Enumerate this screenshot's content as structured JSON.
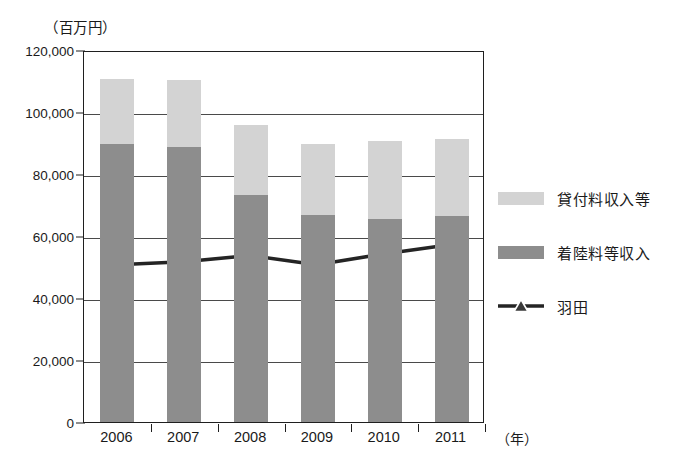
{
  "chart_data": {
    "type": "bar",
    "title": "",
    "subtitle": "",
    "unit_label": "（百万円）",
    "xlabel": "（年）",
    "ylabel": "",
    "categories": [
      "2006",
      "2007",
      "2008",
      "2009",
      "2010",
      "2011"
    ],
    "ylim": [
      0,
      120000
    ],
    "ytick_labels": [
      "0",
      "20,000",
      "40,000",
      "60,000",
      "80,000",
      "100,000",
      "120,000"
    ],
    "ytick_values": [
      0,
      20000,
      40000,
      60000,
      80000,
      100000,
      120000
    ],
    "grid": true,
    "legend_position": "right",
    "stacked": true,
    "series": [
      {
        "name": "着陸料等収入",
        "kind": "bar",
        "stack_order": 0,
        "color": "#8d8d8d",
        "values": [
          89700,
          88700,
          73200,
          66800,
          65500,
          66500
        ]
      },
      {
        "name": "貸付料収入等",
        "kind": "bar",
        "stack_order": 1,
        "color": "#d3d3d3",
        "values": [
          20900,
          21600,
          22600,
          22900,
          25100,
          24800
        ]
      },
      {
        "name": "羽田",
        "kind": "line",
        "color": "#242424",
        "marker": "triangle",
        "values": [
          51000,
          52000,
          54000,
          51000,
          54500,
          57500
        ]
      }
    ],
    "bar_totals": [
      110600,
      110300,
      95800,
      89700,
      90600,
      91300
    ]
  },
  "legend": {
    "items": [
      {
        "label": "貸付料収入等",
        "swatch": "light"
      },
      {
        "label": "着陸料等収入",
        "swatch": "dark"
      },
      {
        "label": "羽田",
        "swatch": "line-triangle"
      }
    ]
  }
}
